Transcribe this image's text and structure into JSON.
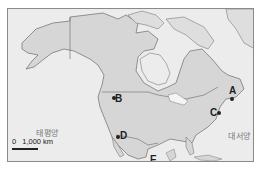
{
  "map": {
    "region": "North America",
    "colors": {
      "ocean": "#ececec",
      "land": "#d6d6d6",
      "arctic_land": "#dedede",
      "border": "#7a7a7a",
      "frame": "#8a8a8a"
    },
    "points": [
      {
        "id": "A",
        "label": "A"
      },
      {
        "id": "B",
        "label": "B"
      },
      {
        "id": "C",
        "label": "C"
      },
      {
        "id": "D",
        "label": "D"
      },
      {
        "id": "E",
        "label": "E"
      }
    ],
    "oceans": {
      "pacific": "태평양",
      "atlantic": "대서양"
    },
    "scale": {
      "zero": "0",
      "distance": "1,000 km"
    }
  }
}
